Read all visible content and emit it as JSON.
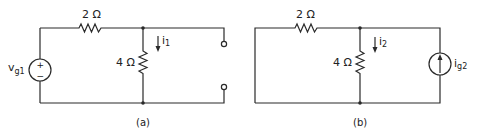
{
  "circuits": [
    {
      "id": "a",
      "caption": "(a)",
      "series_resistor": "2 Ω",
      "shunt_resistor": "4 Ω",
      "current_label_main": "i",
      "current_label_sub": "1",
      "source_label_main": "v",
      "source_label_sub": "g1",
      "source_type": "voltage-source",
      "source_plus": "+",
      "source_minus": "−",
      "output": "open-terminals"
    },
    {
      "id": "b",
      "caption": "(b)",
      "series_resistor": "2 Ω",
      "shunt_resistor": "4 Ω",
      "current_label_main": "i",
      "current_label_sub": "2",
      "source_label_main": "i",
      "source_label_sub": "g2",
      "source_type": "current-source",
      "left_side": "short-circuit"
    }
  ],
  "colors": {
    "ink": "#2a2a2a",
    "background": "#ffffff"
  }
}
